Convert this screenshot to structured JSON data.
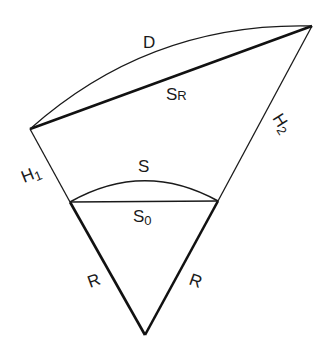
{
  "diagram": {
    "type": "geometry",
    "labels": {
      "D": "D",
      "SR_main": "S",
      "SR_sub": "R",
      "S": "S",
      "S0_main": "S",
      "S0_sub": "0",
      "H1_main": "H",
      "H1_sub": "1",
      "H2_main": "H",
      "H2_sub": "2",
      "R_left": "R",
      "R_right": "R"
    },
    "points": {
      "centre": [
        145,
        335
      ],
      "surface_left": [
        70,
        202
      ],
      "surface_right": [
        218,
        201
      ],
      "top_left": [
        30,
        129
      ],
      "top_right": [
        312,
        26
      ]
    },
    "colors": {
      "stroke": "#1a1a1a",
      "background": "#ffffff"
    }
  }
}
